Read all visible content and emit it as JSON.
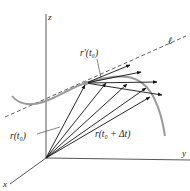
{
  "figure": {
    "axes": {
      "x_label": "x",
      "y_label": "y",
      "z_label": "z"
    },
    "labels": {
      "tangent_line": "ℓ",
      "derivative_vector": "r′(t₀)",
      "position_vector": "r(t₀)",
      "displaced_position_vector": "r(t₀ + Δt)"
    },
    "colors": {
      "axis": "#444444",
      "curve": "#9a9a9a",
      "vector": "#111111",
      "dashed_line": "#333333",
      "point": "#999999"
    }
  }
}
